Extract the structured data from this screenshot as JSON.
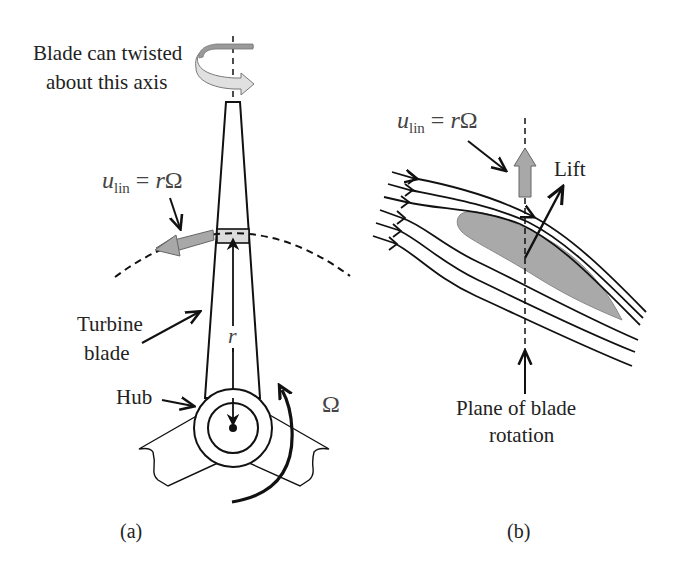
{
  "figure": {
    "panel_a": {
      "caption": "(a)",
      "twist_label_line1": "Blade can twisted",
      "twist_label_line2": "about this axis",
      "velocity_label": {
        "symbol": "u",
        "subscript": "lin",
        "equals": " = ",
        "rhs_var": "r",
        "rhs_omega": "Ω"
      },
      "blade_label_line1": "Turbine",
      "blade_label_line2": "blade",
      "hub_label": "Hub",
      "radius_label": "r",
      "omega_label": "Ω"
    },
    "panel_b": {
      "caption": "(b)",
      "velocity_label": {
        "symbol": "u",
        "subscript": "lin",
        "equals": " = ",
        "rhs_var": "r",
        "rhs_omega": "Ω"
      },
      "lift_label": "Lift",
      "plane_label_line1": "Plane of blade",
      "plane_label_line2": "rotation"
    },
    "colors": {
      "stroke": "#111111",
      "fill_gray": "#a9a9a9",
      "fill_light": "#d9d9d9",
      "text": "#222222",
      "math_text": "#555555"
    }
  }
}
